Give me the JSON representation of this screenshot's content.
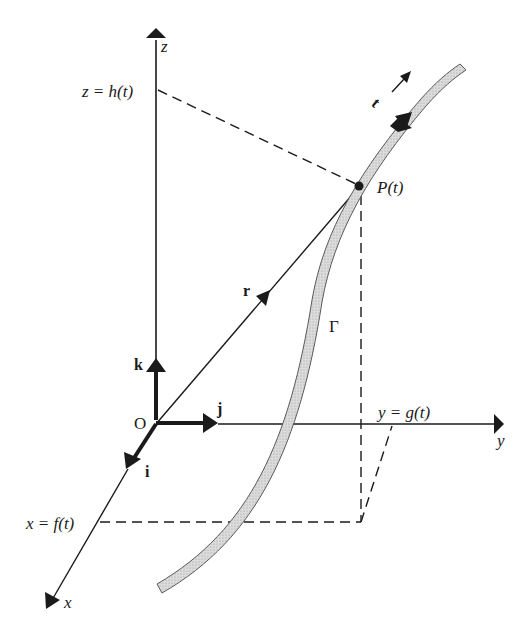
{
  "diagram": {
    "type": "3d-parametric-curve",
    "axes": {
      "x": "x",
      "y": "y",
      "z": "z",
      "origin": "O"
    },
    "unit_vectors": {
      "i": "i",
      "j": "j",
      "k": "k"
    },
    "projections": {
      "x": "x = f(t)",
      "y": "y = g(t)",
      "z": "z = h(t)"
    },
    "point": "P(t)",
    "position_vector": "r",
    "tangent_vector": "t",
    "curve": "Γ",
    "colors": {
      "ink": "#1a1a1a",
      "curve_fill": "#d4d4d4",
      "curve_edge": "#6a6a6a",
      "background": "#ffffff"
    }
  }
}
